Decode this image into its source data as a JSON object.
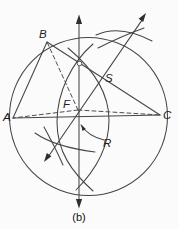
{
  "figure": {
    "type": "geometry-construction-diagram",
    "caption": "(b)",
    "colors": {
      "background": "#fbfbfb",
      "stroke": "#454545",
      "label": "#1c1c1c"
    },
    "labels": {
      "A": "A",
      "B": "B",
      "C": "C",
      "F": "F",
      "S": "S",
      "R": "R"
    },
    "geometry": {
      "vertex_A": {
        "x": 13,
        "y": 118
      },
      "vertex_B": {
        "x": 47,
        "y": 42
      },
      "vertex_C": {
        "x": 160,
        "y": 115
      },
      "center_F": {
        "x": 78,
        "y": 110
      },
      "circle": {
        "cx": 88.5,
        "cy": 116.5,
        "r": 79
      }
    }
  }
}
